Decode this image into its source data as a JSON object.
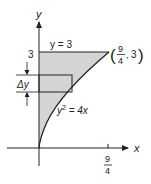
{
  "diagram": {
    "type": "region-between-curves",
    "axes": {
      "x_label": "x",
      "y_label": "y",
      "x_tick": {
        "numerator": "9",
        "denominator": "4"
      },
      "y_tick": "3"
    },
    "curves": {
      "line_label": "y = 3",
      "parabola_label_base": "y",
      "parabola_label_exp": "2",
      "parabola_label_rest": " = 4x"
    },
    "point": {
      "open": "(",
      "x_numerator": "9",
      "x_denominator": "4",
      "sep": ",",
      "y": "3",
      "close": ")"
    },
    "strip": {
      "label": "Δy"
    },
    "colors": {
      "shade": "#d4d4d4",
      "stroke": "#222222"
    }
  }
}
